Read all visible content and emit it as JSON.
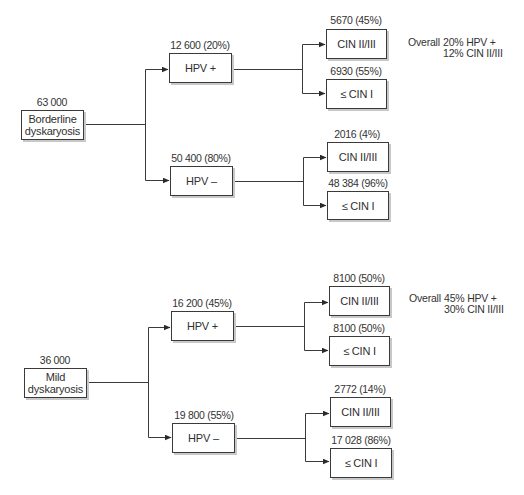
{
  "diagram": {
    "type": "decision-tree",
    "trees": [
      {
        "root": {
          "count": "63 000",
          "label_line1": "Borderline",
          "label_line2": "dyskaryosis"
        },
        "branches": [
          {
            "count": "12 600 (20%)",
            "label": "HPV +",
            "outcomes": [
              {
                "count": "5670 (45%)",
                "label": "CIN II/III"
              },
              {
                "count": "6930 (55%)",
                "label": "≤ CIN I"
              }
            ]
          },
          {
            "count": "50 400 (80%)",
            "label": "HPV –",
            "outcomes": [
              {
                "count": "2016 (4%)",
                "label": "CIN II/III"
              },
              {
                "count": "48 384 (96%)",
                "label": "≤ CIN I"
              }
            ]
          }
        ],
        "overall": {
          "key": "Overall",
          "line1": "20% HPV +",
          "line2": "12% CIN II/III"
        }
      },
      {
        "root": {
          "count": "36 000",
          "label_line1": "Mild",
          "label_line2": "dyskaryosis"
        },
        "branches": [
          {
            "count": "16 200 (45%)",
            "label": "HPV +",
            "outcomes": [
              {
                "count": "8100 (50%)",
                "label": "CIN II/III"
              },
              {
                "count": "8100 (50%)",
                "label": "≤ CIN I"
              }
            ]
          },
          {
            "count": "19 800 (55%)",
            "label": "HPV –",
            "outcomes": [
              {
                "count": "2772 (14%)",
                "label": "CIN II/III"
              },
              {
                "count": "17 028 (86%)",
                "label": "≤ CIN I"
              }
            ]
          }
        ],
        "overall": {
          "key": "Overall",
          "line1": "45% HPV +",
          "line2": "30% CIN II/III"
        }
      }
    ]
  },
  "colors": {
    "line": "#3a3a3a",
    "shadow": "#c8c8c8",
    "text": "#2f2f2f",
    "background": "#ffffff"
  }
}
